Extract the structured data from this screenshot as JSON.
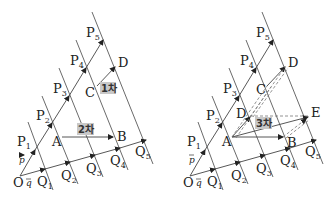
{
  "diagrams": [
    {
      "id": "left",
      "origin_label": "O",
      "p_vector_label": "p",
      "q_vector_label": "q",
      "p_points": [
        "P1",
        "P2",
        "P3",
        "P4",
        "P5"
      ],
      "q_points": [
        "Q1",
        "Q2",
        "Q3",
        "Q4",
        "Q5"
      ],
      "points": {
        "A": "A",
        "B": "B",
        "C": "C",
        "D": "D"
      },
      "tags": [
        {
          "label": "1차",
          "from": "C",
          "to": "D"
        },
        {
          "label": "2차",
          "from": "A",
          "to": "B"
        }
      ]
    },
    {
      "id": "right",
      "origin_label": "O",
      "p_vector_label": "p",
      "q_vector_label": "q",
      "p_points": [
        "P1",
        "P2",
        "P3",
        "P4",
        "P5"
      ],
      "q_points": [
        "Q1",
        "Q2",
        "Q3",
        "Q4",
        "Q5"
      ],
      "points": {
        "A": "A",
        "B": "B",
        "C": "C",
        "D": "D",
        "D2": "D",
        "E": "E"
      },
      "tags": [
        {
          "label": "3차",
          "from": "A",
          "to": "E"
        }
      ]
    }
  ],
  "labels": {
    "O": "O",
    "A": "A",
    "B": "B",
    "C": "C",
    "D": "D",
    "E": "E",
    "P": "P",
    "Q": "Q",
    "p": "p",
    "q": "q",
    "n1": "1",
    "n2": "2",
    "n3": "3",
    "n4": "4",
    "n5": "5",
    "tag1": "1차",
    "tag2": "2차",
    "tag3": "3차"
  },
  "colors": {
    "line": "#444444",
    "dashed": "#777777",
    "tag_bg": "#c8c8c8"
  }
}
